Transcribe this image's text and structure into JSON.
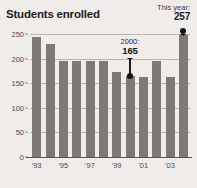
{
  "header": {
    "title": "Students enrolled",
    "this_year_label": "This year:",
    "this_year_value": "257"
  },
  "colors": {
    "background": "#efecea",
    "bar": "#7c7977",
    "gridline": "#b9b4b0",
    "axis_text": "#4a4a4a",
    "title_text": "#231f20",
    "annotation": "#141414"
  },
  "annotations": [
    {
      "name": "callout-2000",
      "year_label": "2000:",
      "value_label": "165",
      "value": 165,
      "category": "'00"
    },
    {
      "name": "callout-this-year",
      "year_label": "",
      "value_label": "257",
      "value": 257,
      "category": "'04"
    }
  ],
  "chart_data": {
    "type": "bar",
    "title": "Students enrolled",
    "xlabel": "",
    "ylabel": "",
    "ylim": [
      0,
      250
    ],
    "yticks": [
      "0",
      "50",
      "100",
      "150",
      "200",
      "250"
    ],
    "grid": true,
    "legend": "none",
    "categories": [
      "'93",
      "'94",
      "'95",
      "'96",
      "'97",
      "'98",
      "'99",
      "'00",
      "'01",
      "'02",
      "'03",
      "'04"
    ],
    "tick_labels_shown": [
      "'93",
      "'95",
      "'97",
      "'99",
      "'01",
      "'03"
    ],
    "values": [
      244,
      230,
      195,
      195,
      195,
      195,
      173,
      165,
      163,
      195,
      163,
      248
    ],
    "annotated_points": [
      {
        "category": "'00",
        "value": 165,
        "label": "2000: 165"
      },
      {
        "category": "'04",
        "value": 257,
        "label": "This year: 257"
      }
    ]
  }
}
